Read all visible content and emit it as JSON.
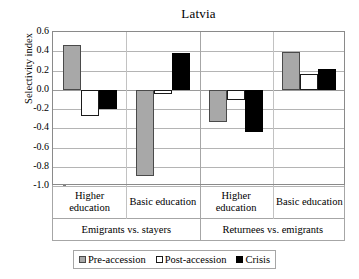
{
  "chart_data": {
    "type": "bar",
    "title": "Latvia",
    "xlabel": "",
    "ylabel": "Selectivity index",
    "ylim": [
      -1.0,
      0.6
    ],
    "ytick_step": 0.2,
    "yticks": [
      "0.6",
      "0.4",
      "0.2",
      "0.0",
      "-0.2",
      "-0.4",
      "-0.6",
      "-0.8",
      "-1.0"
    ],
    "ytick_values": [
      0.6,
      0.4,
      0.2,
      0.0,
      -0.2,
      -0.4,
      -0.6,
      -0.8,
      -1.0
    ],
    "grid": true,
    "legend_position": "bottom",
    "categories": [
      "Higher education",
      "Basic education",
      "Higher education",
      "Basic education"
    ],
    "group_labels": [
      "Emigrants vs. stayers",
      "Returnees vs. emigrants"
    ],
    "series": [
      {
        "name": "Pre-accession",
        "color": "#a8a8a8",
        "values": [
          0.46,
          -0.9,
          -0.34,
          0.39
        ]
      },
      {
        "name": "Post-accession",
        "color": "#ffffff",
        "values": [
          -0.27,
          -0.04,
          -0.11,
          0.16
        ]
      },
      {
        "name": "Crisis",
        "color": "#000000",
        "values": [
          -0.2,
          0.38,
          -0.44,
          0.22
        ]
      }
    ]
  },
  "legend": {
    "items": [
      {
        "label": "Pre-accession",
        "swatch": "gray-square-icon"
      },
      {
        "label": "Post-accession",
        "swatch": "white-square-icon"
      },
      {
        "label": "Crisis",
        "swatch": "black-square-icon"
      }
    ]
  }
}
